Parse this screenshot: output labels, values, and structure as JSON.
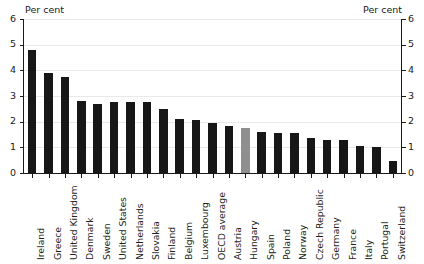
{
  "chart": {
    "axis_caption_left": "Per cent",
    "axis_caption_right": "Per cent",
    "highlight_color": "#8f8f8f",
    "bar_color": "#171717"
  },
  "chart_data": {
    "type": "bar",
    "title": "",
    "subtitle": "",
    "xlabel": "",
    "ylabel": "Per cent",
    "ylabel_right": "Per cent",
    "ylim": [
      0,
      6
    ],
    "yticks": [
      0,
      1,
      2,
      3,
      4,
      5,
      6
    ],
    "ytick_labels": [
      "0",
      "1",
      "2",
      "3",
      "4",
      "5",
      "6"
    ],
    "grid": true,
    "legend": "none",
    "categories": [
      "Ireland",
      "Greece",
      "United Kingdom",
      "Denmark",
      "Sweden",
      "United States",
      "Netherlands",
      "Slovakia",
      "Finland",
      "Belgium",
      "Luxembourg",
      "OECD average",
      "Austria",
      "Hungary",
      "Spain",
      "Poland",
      "Norway",
      "Czech Republic",
      "Germany",
      "France",
      "Italy",
      "Portugal",
      "Switzerland"
    ],
    "values": [
      4.8,
      3.9,
      3.75,
      2.8,
      2.7,
      2.75,
      2.75,
      2.75,
      2.5,
      2.1,
      2.05,
      1.95,
      1.85,
      1.75,
      1.6,
      1.55,
      1.55,
      1.35,
      1.3,
      1.3,
      1.05,
      1.0,
      0.45
    ],
    "highlight_index": 13,
    "highlight_category": "Hungary"
  }
}
